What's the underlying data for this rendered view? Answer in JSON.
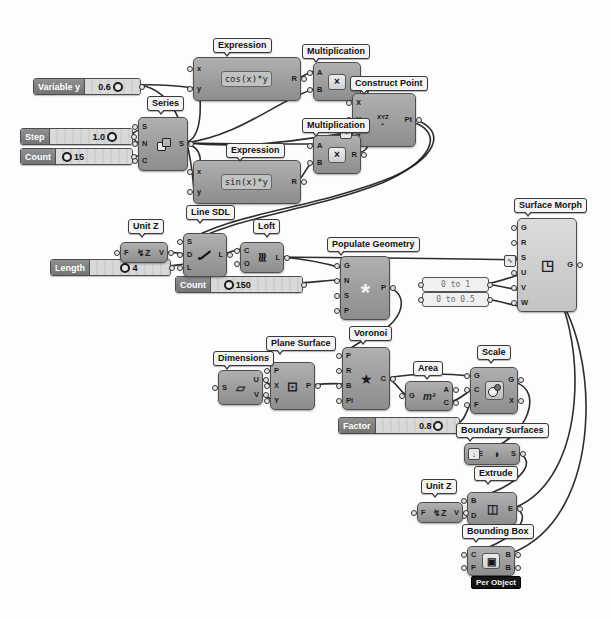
{
  "canvas": {
    "background": "#fdfdfd",
    "wire_color": "#1b1b1b",
    "node_color": "#9e9e9e",
    "selected_panel_color": "#f0f0f0"
  },
  "nodes": {
    "expression_cos": {
      "label": "Expression",
      "expression": "cos(x)*y",
      "in": [
        "x",
        "y"
      ],
      "out": [
        "R"
      ]
    },
    "multiplication_1": {
      "label": "Multiplication",
      "icon": "×",
      "in": [
        "A",
        "B"
      ],
      "out": [
        "R"
      ]
    },
    "construct_point": {
      "label": "Construct Point",
      "icon": "XYZ",
      "icon2": "⌄",
      "in": [
        "X",
        "Y",
        "Z"
      ],
      "out": [
        "Pt"
      ]
    },
    "series": {
      "label": "Series",
      "in": [
        "S",
        "N",
        "C"
      ],
      "out": [
        "S"
      ]
    },
    "multiplication_2": {
      "label": "Multiplication",
      "icon": "×",
      "in": [
        "A",
        "B"
      ],
      "out": [
        "R"
      ]
    },
    "expression_sin": {
      "label": "Expression",
      "expression": "sin(x)*y",
      "in": [
        "x",
        "y"
      ],
      "out": [
        "R"
      ]
    },
    "unit_z_1": {
      "label": "Unit Z",
      "icon": "↯Z",
      "in": [
        "F"
      ],
      "out": [
        "V"
      ]
    },
    "line_sdl": {
      "label": "Line SDL",
      "in": [
        "S",
        "D",
        "L"
      ],
      "out": [
        "L"
      ]
    },
    "loft": {
      "label": "Loft",
      "icon": "≋",
      "in": [
        "C",
        "O"
      ],
      "out": [
        "L"
      ]
    },
    "populate_geometry": {
      "label": "Populate Geometry",
      "icon": "*",
      "in": [
        "G",
        "N",
        "S",
        "P"
      ],
      "out": [
        "P"
      ]
    },
    "surface_morph": {
      "label": "Surface Morph",
      "icon": "◳",
      "in": [
        "G",
        "R",
        "S",
        "U",
        "V",
        "W"
      ],
      "out": [
        "G"
      ]
    },
    "dimensions": {
      "label": "Dimensions",
      "icon": "▱",
      "in": [
        "S"
      ],
      "out": [
        "U",
        "V"
      ]
    },
    "plane_surface": {
      "label": "Plane Surface",
      "icon": "⊡",
      "in": [
        "P",
        "X",
        "Y"
      ],
      "out": [
        "P"
      ]
    },
    "voronoi": {
      "label": "Voronoi",
      "icon": "★",
      "in": [
        "P",
        "R",
        "B",
        "Pl"
      ],
      "out": [
        "C"
      ]
    },
    "area": {
      "label": "Area",
      "icon": "m²",
      "in": [
        "G"
      ],
      "out": [
        "A",
        "C"
      ]
    },
    "scale": {
      "label": "Scale",
      "in": [
        "G",
        "C",
        "F"
      ],
      "out": [
        "G",
        "X"
      ]
    },
    "boundary_surfaces": {
      "label": "Boundary Surfaces",
      "icon": "◗",
      "in": [
        "E"
      ],
      "out": [
        "S"
      ]
    },
    "extrude": {
      "label": "Extrude",
      "icon": "◫",
      "in": [
        "B",
        "D"
      ],
      "out": [
        "E"
      ]
    },
    "unit_z_2": {
      "label": "Unit Z",
      "icon": "↯Z",
      "in": [
        "F"
      ],
      "out": [
        "V"
      ]
    },
    "bounding_box": {
      "label": "Bounding Box",
      "icon": "▣",
      "tag": "Per Object",
      "in": [
        "C",
        "P"
      ],
      "out": [
        "B",
        "B"
      ]
    }
  },
  "sliders": {
    "variable_y": {
      "name": "Variable y",
      "value": "0.6"
    },
    "step": {
      "name": "Step",
      "value": "1.0"
    },
    "count": {
      "name": "Count",
      "value": "15"
    },
    "length": {
      "name": "Length",
      "value": "4"
    },
    "count_150": {
      "name": "Count",
      "value": "150"
    },
    "factor": {
      "name": "Factor",
      "value": "0.8"
    }
  },
  "panels": {
    "range_1": "0 to 1",
    "range_2": "0 to 0.5"
  },
  "badges": {
    "flatten_icon": "↓",
    "graph_icon": "∿",
    "expression_icon": "✎"
  }
}
